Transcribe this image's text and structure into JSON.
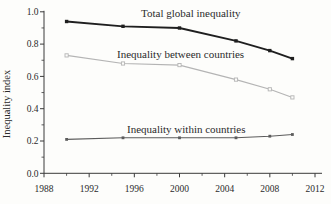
{
  "figure": {
    "background": "#fdfdfb",
    "text_color": "#2b2b2b",
    "axis_color": "#3a3a3a"
  },
  "chart_data": {
    "type": "line",
    "title": "",
    "xlabel": "",
    "ylabel": "Inequality index",
    "xlim": [
      1988,
      2012
    ],
    "ylim": [
      0.0,
      1.0
    ],
    "grid": false,
    "legend": "inline-annotations",
    "x_major_ticks": [
      1988,
      1992,
      1996,
      2000,
      2004,
      2008,
      2012
    ],
    "x_minor_step": 2,
    "y_major_ticks": [
      0.0,
      0.2,
      0.4,
      0.6,
      0.8,
      1.0
    ],
    "y_minor_step": 0.1,
    "x": [
      1990,
      1995,
      2000,
      2005,
      2008,
      2010
    ],
    "series": [
      {
        "name": "Total global inequality",
        "values": [
          0.94,
          0.91,
          0.9,
          0.82,
          0.76,
          0.71
        ],
        "color": "#1f1f1f",
        "line_width": 1.8,
        "marker": "square-filled",
        "marker_size": 3.4
      },
      {
        "name": "Inequality between countries",
        "values": [
          0.73,
          0.68,
          0.67,
          0.58,
          0.52,
          0.47
        ],
        "color": "#b4b4b4",
        "line_width": 1.1,
        "marker": "square-open",
        "marker_size": 3.2
      },
      {
        "name": "Inequality within countries",
        "values": [
          0.21,
          0.22,
          0.22,
          0.22,
          0.23,
          0.24
        ],
        "color": "#5c5c5c",
        "line_width": 1.1,
        "marker": "square-filled",
        "marker_size": 2.8
      }
    ],
    "annotations": [
      {
        "text": "Total global inequality",
        "x": 2001.0,
        "y": 0.968,
        "font_size": 11
      },
      {
        "text": "Inequality between countries",
        "x": 2000.1,
        "y": 0.714,
        "font_size": 11
      },
      {
        "text": "Inequality within countries",
        "x": 2000.6,
        "y": 0.25,
        "font_size": 11
      }
    ]
  }
}
